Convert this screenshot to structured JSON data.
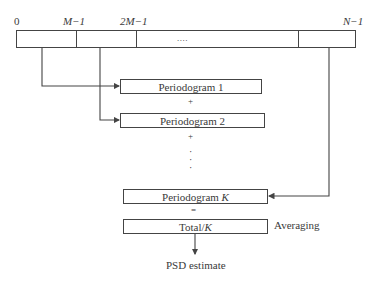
{
  "top_bar": {
    "tick_labels": {
      "start": "0",
      "m_minus_1": "M−1",
      "two_m_minus_1": "2M−1",
      "n_minus_1": "N−1"
    },
    "ellipsis": "...."
  },
  "blocks": {
    "periodogram_1": "Periodogram 1",
    "plus_1": "+",
    "periodogram_2": "Periodogram 2",
    "plus_2": "+",
    "vertical_dots": "·",
    "periodogram_k_prefix": "Periodogram ",
    "periodogram_k_var": "K",
    "equals": "=",
    "total_prefix": "Total/",
    "total_var": "K",
    "averaging_label": "Averaging",
    "output_label": "PSD estimate"
  },
  "colors": {
    "line": "#444444",
    "text": "#3a3a3a",
    "background": "#ffffff"
  }
}
